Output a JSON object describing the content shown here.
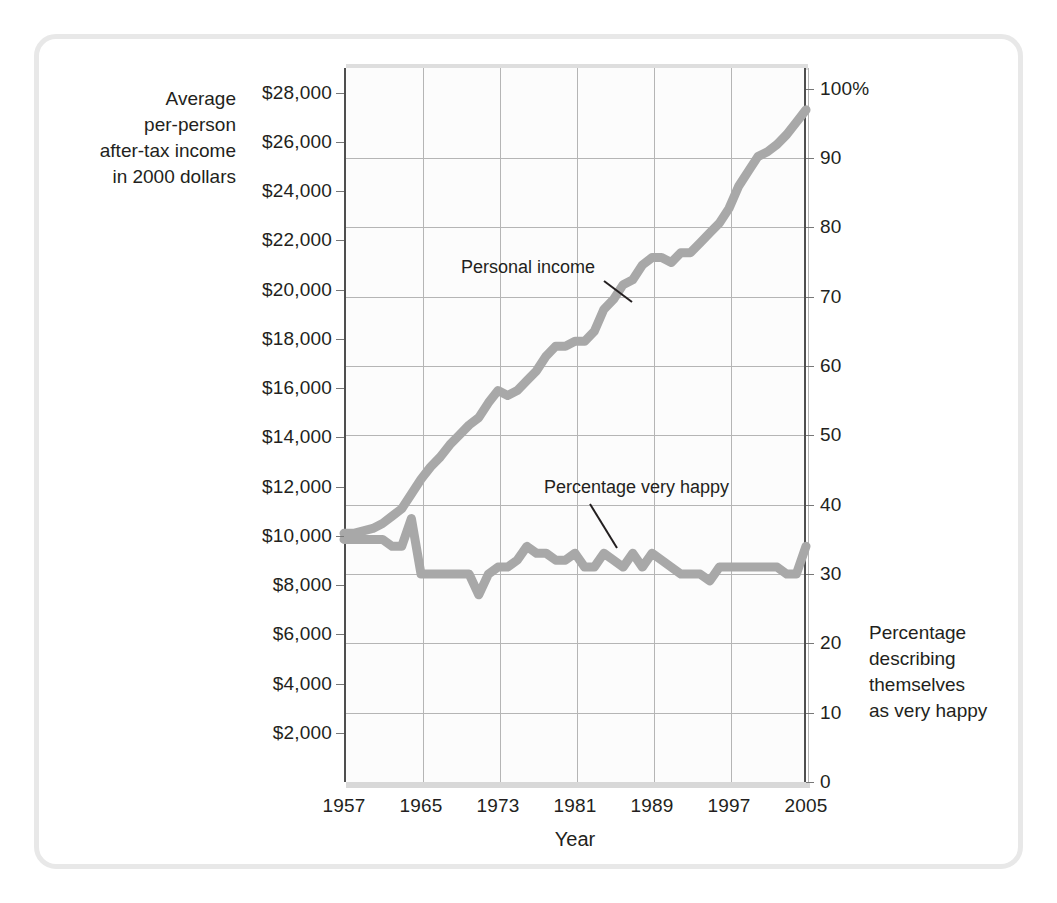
{
  "figure": {
    "frame_color": "#e8e8e8",
    "plot_bg": "#fcfcfc",
    "grid_color": "#b5b5b5",
    "axis_color": "#4f4f4f",
    "series_color": "#a8a8a8"
  },
  "axes": {
    "left_title": [
      "Average",
      "per-person",
      "after-tax income",
      "in 2000 dollars"
    ],
    "right_title": [
      "Percentage",
      "describing",
      "themselves",
      "as very happy"
    ],
    "x_title": "Year",
    "left_ticks": [
      "$28,000",
      "$26,000",
      "$24,000",
      "$22,000",
      "$20,000",
      "$18,000",
      "$16,000",
      "$14,000",
      "$12,000",
      "$10,000",
      "$8,000",
      "$6,000",
      "$4,000",
      "$2,000"
    ],
    "right_ticks": [
      "100%",
      "90",
      "80",
      "70",
      "60",
      "50",
      "40",
      "30",
      "20",
      "10",
      "0"
    ],
    "x_ticks": [
      "1957",
      "1965",
      "1973",
      "1981",
      "1989",
      "1997",
      "2005"
    ]
  },
  "annotations": {
    "income": "Personal income",
    "happiness": "Percentage very happy"
  },
  "chart_data": {
    "type": "line",
    "title": "",
    "xlabel": "Year",
    "ylabel": "Average per-person after-tax income in 2000 dollars",
    "ylabel_right": "Percentage describing themselves as very happy",
    "xlim": [
      1957,
      2005
    ],
    "ylim_left": [
      0,
      29000
    ],
    "ylim_right": [
      0,
      103
    ],
    "grid": true,
    "legend": "inline-annotations",
    "series": [
      {
        "name": "Personal income",
        "axis": "left",
        "unit": "2000 dollars",
        "color": "#a8a8a8",
        "x": [
          1957,
          1958,
          1959,
          1960,
          1961,
          1962,
          1963,
          1964,
          1965,
          1966,
          1967,
          1968,
          1969,
          1970,
          1971,
          1972,
          1973,
          1974,
          1975,
          1976,
          1977,
          1978,
          1979,
          1980,
          1981,
          1982,
          1983,
          1984,
          1985,
          1986,
          1987,
          1988,
          1989,
          1990,
          1991,
          1992,
          1993,
          1994,
          1995,
          1996,
          1997,
          1998,
          1999,
          2000,
          2001,
          2002,
          2003,
          2004,
          2005
        ],
        "values": [
          10100,
          10100,
          10200,
          10300,
          10500,
          10800,
          11100,
          11700,
          12300,
          12800,
          13200,
          13700,
          14100,
          14500,
          14800,
          15400,
          15900,
          15700,
          15900,
          16300,
          16700,
          17300,
          17700,
          17700,
          17900,
          17900,
          18300,
          19200,
          19600,
          20200,
          20400,
          21000,
          21300,
          21300,
          21100,
          21500,
          21500,
          21900,
          22300,
          22700,
          23300,
          24200,
          24800,
          25400,
          25600,
          25900,
          26300,
          26800,
          27300
        ]
      },
      {
        "name": "Percentage very happy",
        "axis": "right",
        "unit": "percent",
        "color": "#a8a8a8",
        "x": [
          1957,
          1958,
          1959,
          1960,
          1961,
          1962,
          1963,
          1964,
          1965,
          1966,
          1967,
          1968,
          1969,
          1970,
          1971,
          1972,
          1973,
          1974,
          1975,
          1976,
          1977,
          1978,
          1979,
          1980,
          1981,
          1982,
          1983,
          1984,
          1985,
          1986,
          1987,
          1988,
          1989,
          1990,
          1991,
          1992,
          1993,
          1994,
          1995,
          1996,
          1997,
          1998,
          1999,
          2000,
          2001,
          2002,
          2003,
          2004,
          2005
        ],
        "values": [
          35,
          35,
          35,
          35,
          35,
          34,
          34,
          38,
          30,
          30,
          30,
          30,
          30,
          30,
          27,
          30,
          31,
          31,
          32,
          34,
          33,
          33,
          32,
          32,
          33,
          31,
          31,
          33,
          32,
          31,
          33,
          31,
          33,
          32,
          31,
          30,
          30,
          30,
          29,
          31,
          31,
          31,
          31,
          31,
          31,
          31,
          30,
          30,
          34
        ]
      }
    ]
  }
}
